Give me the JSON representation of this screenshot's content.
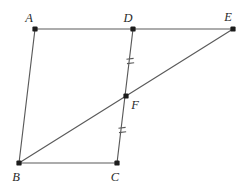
{
  "figure": {
    "background_color": "#ffffff",
    "line_color": "#5a5a5a",
    "vertex_color": "#1c1c1c",
    "label_color": "#2a2a2a",
    "cropped_top_caption": "",
    "vertices": [
      {
        "id": "A",
        "label": "A",
        "x": 35,
        "y": 29,
        "label_x": 29,
        "label_y": 22
      },
      {
        "id": "D",
        "label": "D",
        "x": 133,
        "y": 29,
        "label_x": 127,
        "label_y": 22
      },
      {
        "id": "E",
        "label": "E",
        "x": 233,
        "y": 29,
        "label_x": 226,
        "label_y": 21
      },
      {
        "id": "F",
        "label": "F",
        "x": 126,
        "y": 96,
        "label_x": 132,
        "label_y": 109
      },
      {
        "id": "B",
        "label": "B",
        "x": 19,
        "y": 163,
        "label_x": 13,
        "label_y": 181
      },
      {
        "id": "C",
        "label": "C",
        "x": 117,
        "y": 163,
        "label_x": 111,
        "label_y": 181
      }
    ],
    "edges": [
      {
        "name": "segment-A-D",
        "from": "A",
        "to": "D"
      },
      {
        "name": "segment-D-E",
        "from": "D",
        "to": "E"
      },
      {
        "name": "segment-A-B",
        "from": "A",
        "to": "B"
      },
      {
        "name": "segment-B-C",
        "from": "B",
        "to": "C"
      },
      {
        "name": "segment-D-C",
        "from": "D",
        "to": "C"
      },
      {
        "name": "segment-B-E",
        "from": "B",
        "to": "E"
      }
    ],
    "congruence_ticks": [
      {
        "name": "tick-DF",
        "segment": "D-F",
        "marks": 2,
        "x": 130,
        "y": 61,
        "angle": -6
      },
      {
        "name": "tick-FC",
        "segment": "F-C",
        "marks": 2,
        "x": 122,
        "y": 130,
        "angle": -6
      }
    ]
  }
}
